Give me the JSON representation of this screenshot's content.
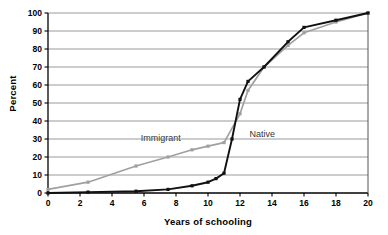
{
  "chart_data": {
    "type": "line",
    "title": "",
    "xlabel": "Years of schooling",
    "ylabel": "Percent",
    "xlim": [
      0,
      20
    ],
    "ylim": [
      0,
      100
    ],
    "xticks": [
      0,
      2,
      4,
      6,
      8,
      10,
      12,
      14,
      16,
      18,
      20
    ],
    "yticks": [
      0,
      10,
      20,
      30,
      40,
      50,
      60,
      70,
      80,
      90,
      100
    ],
    "grid": "horizontal",
    "legend_position": "inline-annotations",
    "series": [
      {
        "name": "Immigrant",
        "color": "#a0a0a0",
        "marker": "square",
        "annotation": "Immigrant",
        "points": [
          {
            "x": 0,
            "y": 2
          },
          {
            "x": 2.5,
            "y": 6
          },
          {
            "x": 5.5,
            "y": 15
          },
          {
            "x": 7.5,
            "y": 20
          },
          {
            "x": 9,
            "y": 24
          },
          {
            "x": 10,
            "y": 26
          },
          {
            "x": 11,
            "y": 28
          },
          {
            "x": 12,
            "y": 44
          },
          {
            "x": 12.5,
            "y": 57
          },
          {
            "x": 13.5,
            "y": 70
          },
          {
            "x": 15,
            "y": 82
          },
          {
            "x": 16,
            "y": 89
          },
          {
            "x": 18,
            "y": 95
          },
          {
            "x": 20,
            "y": 100
          }
        ]
      },
      {
        "name": "Native",
        "color": "#111111",
        "marker": "square",
        "annotation": "Native",
        "points": [
          {
            "x": 0,
            "y": 0
          },
          {
            "x": 2.5,
            "y": 0.5
          },
          {
            "x": 5.5,
            "y": 1
          },
          {
            "x": 7.5,
            "y": 2
          },
          {
            "x": 9,
            "y": 4
          },
          {
            "x": 10,
            "y": 6
          },
          {
            "x": 10.5,
            "y": 8
          },
          {
            "x": 11,
            "y": 11
          },
          {
            "x": 11.5,
            "y": 30
          },
          {
            "x": 12,
            "y": 52
          },
          {
            "x": 12.5,
            "y": 62
          },
          {
            "x": 13.5,
            "y": 70
          },
          {
            "x": 15,
            "y": 84
          },
          {
            "x": 16,
            "y": 92
          },
          {
            "x": 18,
            "y": 96
          },
          {
            "x": 20,
            "y": 100
          }
        ]
      }
    ],
    "annotations": [
      {
        "text": "Immigrant",
        "x": 5.8,
        "y": 30
      },
      {
        "text": "Native",
        "x": 12.6,
        "y": 32
      }
    ]
  }
}
